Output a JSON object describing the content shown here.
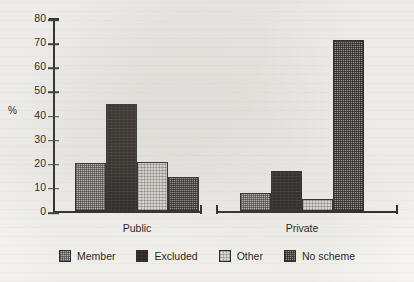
{
  "chart_data": {
    "type": "bar",
    "title": "",
    "subtitle": "",
    "xlabel": "",
    "ylabel": "%",
    "categories": [
      "Public",
      "Private"
    ],
    "ylim": [
      0,
      80
    ],
    "yticks": [
      80,
      70,
      60,
      50,
      40,
      30,
      20,
      10,
      0
    ],
    "ytick_labels": [
      "80",
      "70",
      "60",
      "50",
      "40",
      "30",
      "20",
      "10",
      "0"
    ],
    "grid": false,
    "legend_position": "bottom",
    "series": [
      {
        "name": "Member",
        "values": [
          20.0,
          7.5
        ],
        "pattern": "medium-gray-dither",
        "color": "#b8b6b1"
      },
      {
        "name": "Excluded",
        "values": [
          44.5,
          16.5
        ],
        "pattern": "solid-black",
        "color": "#231f1c"
      },
      {
        "name": "Other",
        "values": [
          20.5,
          5.0
        ],
        "pattern": "light-gray-dither",
        "color": "#e0dedb"
      },
      {
        "name": "No scheme",
        "values": [
          14.0,
          71.0
        ],
        "pattern": "dark-gray-dither",
        "color": "#8c8a85"
      }
    ]
  },
  "legend": {
    "items": [
      {
        "label": "Member"
      },
      {
        "label": "Excluded"
      },
      {
        "label": "Other"
      },
      {
        "label": "No scheme"
      }
    ]
  }
}
